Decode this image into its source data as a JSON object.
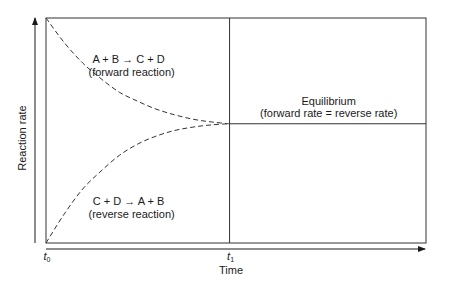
{
  "chart_data": {
    "type": "line",
    "title": "",
    "xlabel": "Time",
    "ylabel": "Reaction rate",
    "x_ticks": [
      {
        "value": 0,
        "label": "t",
        "subscript": "0"
      },
      {
        "value": 1,
        "label": "t",
        "subscript": "1"
      }
    ],
    "xlim": [
      0,
      2.07
    ],
    "ylim": [
      0,
      1
    ],
    "grid": false,
    "equilibrium_rate": 0.53,
    "equilibrium_time": 1,
    "series": [
      {
        "name": "forward",
        "style": "dashed",
        "label_lines": [
          "A + B → C + D",
          "(forward reaction)"
        ],
        "x": [
          0,
          0.1,
          0.2,
          0.3,
          0.4,
          0.5,
          0.6,
          0.7,
          0.8,
          0.9,
          1.0
        ],
        "y": [
          1.0,
          0.89,
          0.8,
          0.73,
          0.67,
          0.63,
          0.595,
          0.57,
          0.55,
          0.538,
          0.53
        ]
      },
      {
        "name": "reverse",
        "style": "dashed",
        "label_lines": [
          "C + D → A + B",
          "(reverse reaction)"
        ],
        "x": [
          0,
          0.1,
          0.2,
          0.3,
          0.4,
          0.5,
          0.6,
          0.7,
          0.8,
          0.9,
          1.0
        ],
        "y": [
          0.0,
          0.13,
          0.24,
          0.32,
          0.39,
          0.44,
          0.475,
          0.5,
          0.515,
          0.525,
          0.53
        ]
      },
      {
        "name": "equilibrium",
        "style": "solid",
        "label_lines": [
          "Equilibrium",
          "(forward rate = reverse rate)"
        ],
        "x": [
          1,
          2.07
        ],
        "y": [
          0.53,
          0.53
        ]
      }
    ],
    "annotations": {
      "forward": {
        "x": 0.45,
        "y": 0.8
      },
      "reverse": {
        "x": 0.45,
        "y": 0.17
      },
      "equilibrium": {
        "x": 1.54,
        "y": 0.6
      }
    }
  }
}
